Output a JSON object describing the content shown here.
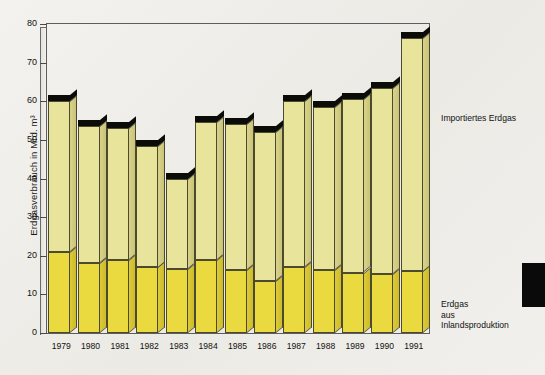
{
  "chart_data": {
    "type": "bar",
    "stacked": true,
    "title": "",
    "xlabel": "",
    "ylabel": "Erdgasverbrauch in Mrd. m³",
    "ylim": [
      0,
      80
    ],
    "ytick_values": [
      0,
      10,
      20,
      30,
      40,
      50,
      60,
      70,
      80
    ],
    "ytick_labels": [
      "0",
      "10",
      "20",
      "30",
      "40",
      "50",
      "60",
      "70",
      "80"
    ],
    "grid": false,
    "legend_position": "right",
    "categories": [
      "1979",
      "1980",
      "1981",
      "1982",
      "1983",
      "1984",
      "1985",
      "1986",
      "1987",
      "1988",
      "1989",
      "1990",
      "1991"
    ],
    "series": [
      {
        "name": "Erdgas aus Inlandsproduktion",
        "color": "#ead93f",
        "values": [
          21.0,
          18.0,
          18.8,
          17.0,
          16.6,
          18.8,
          16.2,
          13.4,
          17.0,
          16.2,
          15.6,
          15.3,
          16.0
        ]
      },
      {
        "name": "Importiertes Erdgas",
        "color": "#e8e49c",
        "values": [
          39.0,
          35.5,
          34.2,
          31.5,
          23.4,
          35.7,
          37.8,
          38.6,
          43.0,
          42.3,
          44.9,
          48.2,
          60.5
        ]
      }
    ],
    "totals": [
      60.0,
      53.5,
      53.0,
      48.5,
      40.0,
      54.5,
      54.0,
      52.0,
      60.0,
      58.5,
      60.5,
      63.5,
      76.5
    ]
  },
  "legend": {
    "import_label": "Importiertes Erdgas",
    "domestic_label": "Erdgas\naus\nInlandsproduktion"
  },
  "colors": {
    "import_fill": "#e8e49c",
    "domestic_fill": "#ead93f",
    "bar_outline": "#4c4a2e",
    "cap": "#0b0b07",
    "background": "#f2f1ed",
    "frame": "#5d5d5d"
  }
}
